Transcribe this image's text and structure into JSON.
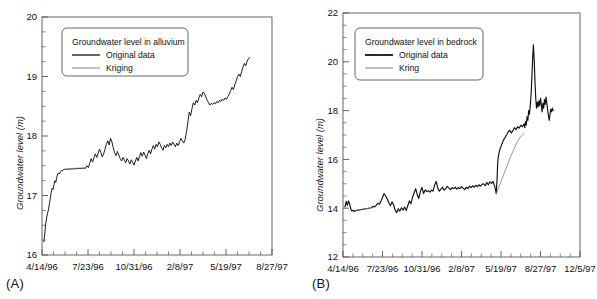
{
  "figure": {
    "background": "#ffffff",
    "line_color": "#111111",
    "axis_color": "#555555"
  },
  "panels": [
    {
      "tag": "(A)",
      "ylabel": "Groundwater level (m)",
      "legend": {
        "title": "Groundwater level in alluvium",
        "entries": [
          {
            "label": "Original data",
            "color": "#111111",
            "width": 1.3
          },
          {
            "label": "Kriging",
            "color": "#777777",
            "width": 0.9
          }
        ]
      },
      "chart_data": {
        "type": "line",
        "title": "Groundwater level in alluvium",
        "xlabel": "",
        "ylabel": "Groundwater level (m)",
        "ylim": [
          16,
          20
        ],
        "yticks": [
          16,
          17,
          18,
          19,
          20
        ],
        "yminor_step": 0.25,
        "xlim": [
          0,
          500
        ],
        "xticks": [
          0,
          100,
          200,
          300,
          400,
          500
        ],
        "xticklabels": [
          "4/14/96",
          "7/23/96",
          "10/31/96",
          "2/8/97",
          "5/19/97",
          "8/27/97"
        ],
        "xminor_per_major": 3,
        "grid": false,
        "legend_position": "upper-left",
        "series": [
          {
            "name": "Original data",
            "color": "#111111",
            "x": [
              4,
              6,
              8,
              10,
              12,
              14,
              16,
              18,
              20,
              22,
              24,
              26,
              28,
              30,
              32,
              34,
              36,
              38,
              40,
              42,
              44,
              46,
              48,
              50,
              95,
              98,
              101,
              104,
              107,
              110,
              113,
              116,
              119,
              122,
              125,
              128,
              131,
              134,
              137,
              140,
              143,
              146,
              149,
              152,
              155,
              158,
              161,
              164,
              167,
              170,
              173,
              176,
              179,
              182,
              185,
              188,
              191,
              194,
              197,
              200,
              203,
              206,
              209,
              212,
              215,
              218,
              221,
              224,
              227,
              230,
              233,
              236,
              239,
              242,
              245,
              248,
              251,
              254,
              257,
              260,
              263,
              266,
              269,
              272,
              275,
              278,
              281,
              284,
              287,
              290,
              293,
              296,
              299,
              302,
              305,
              308,
              311,
              314,
              317,
              320,
              323,
              326,
              329,
              332,
              335,
              338,
              341,
              344,
              347,
              350,
              353,
              356,
              359,
              362,
              365,
              368,
              371,
              374,
              377,
              380,
              383,
              386,
              389,
              392,
              395,
              398,
              401,
              404,
              407,
              410,
              413,
              416,
              419,
              422,
              425,
              428,
              431,
              434,
              437,
              440,
              443,
              446,
              449,
              452
            ],
            "y": [
              16.22,
              16.35,
              16.52,
              16.62,
              16.7,
              16.76,
              16.86,
              16.95,
              17.05,
              17.12,
              17.1,
              17.18,
              17.25,
              17.22,
              17.3,
              17.36,
              17.38,
              17.36,
              17.4,
              17.42,
              17.41,
              17.43,
              17.44,
              17.44,
              17.46,
              17.5,
              17.47,
              17.55,
              17.62,
              17.56,
              17.64,
              17.7,
              17.64,
              17.71,
              17.78,
              17.72,
              17.65,
              17.7,
              17.78,
              17.86,
              17.92,
              17.85,
              17.96,
              17.9,
              17.8,
              17.72,
              17.67,
              17.74,
              17.68,
              17.62,
              17.58,
              17.64,
              17.6,
              17.55,
              17.62,
              17.58,
              17.53,
              17.6,
              17.56,
              17.51,
              17.58,
              17.64,
              17.58,
              17.66,
              17.72,
              17.66,
              17.73,
              17.68,
              17.62,
              17.7,
              17.76,
              17.7,
              17.78,
              17.84,
              17.78,
              17.86,
              17.82,
              17.9,
              17.86,
              17.8,
              17.76,
              17.84,
              17.8,
              17.86,
              17.82,
              17.88,
              17.84,
              17.9,
              17.86,
              17.82,
              17.88,
              17.84,
              17.9,
              17.96,
              17.92,
              17.88,
              17.94,
              18.06,
              18.22,
              18.4,
              18.34,
              18.46,
              18.56,
              18.52,
              18.6,
              18.56,
              18.64,
              18.7,
              18.66,
              18.74,
              18.72,
              18.66,
              18.6,
              18.56,
              18.52,
              18.55,
              18.53,
              18.56,
              18.54,
              18.58,
              18.56,
              18.6,
              18.58,
              18.62,
              18.6,
              18.64,
              18.62,
              18.66,
              18.7,
              18.76,
              18.82,
              18.78,
              18.86,
              18.92,
              19.0,
              19.04,
              19.0,
              19.08,
              19.16,
              19.22,
              19.18,
              19.26,
              19.3,
              19.32
            ]
          },
          {
            "name": "Kriging",
            "color": "#777777",
            "x": [
              50,
              62,
              74,
              86,
              95
            ],
            "y": [
              17.44,
              17.45,
              17.46,
              17.46,
              17.46
            ]
          }
        ]
      }
    },
    {
      "tag": "(B)",
      "ylabel": "Groundwater level (m)",
      "legend": {
        "title": "Groundwater  level in bedrock",
        "entries": [
          {
            "label": "Original data",
            "color": "#111111",
            "width": 1.8
          },
          {
            "label": "Kring",
            "color": "#777777",
            "width": 0.9
          }
        ]
      },
      "chart_data": {
        "type": "line",
        "title": "Groundwater  level in bedrock",
        "xlabel": "",
        "ylabel": "Groundwater level (m)",
        "ylim": [
          12,
          22
        ],
        "yticks": [
          12,
          14,
          16,
          18,
          20,
          22
        ],
        "yminor_step": 0.5,
        "xlim": [
          0,
          600
        ],
        "xticks": [
          0,
          100,
          200,
          300,
          400,
          500,
          600
        ],
        "xticklabels": [
          "4/14/96",
          "7/23/96",
          "10/31/96",
          "2/8/97",
          "5/19/97",
          "8/27/97",
          "12/5/97"
        ],
        "xminor_per_major": 3,
        "grid": false,
        "legend_position": "upper-left",
        "series": [
          {
            "name": "Original data",
            "color": "#111111",
            "x": [
              5,
              8,
              11,
              14,
              17,
              20,
              23,
              26,
              29,
              32,
              72,
              76,
              80,
              84,
              88,
              92,
              96,
              100,
              104,
              108,
              112,
              116,
              120,
              124,
              128,
              132,
              136,
              140,
              144,
              148,
              152,
              156,
              160,
              164,
              168,
              172,
              176,
              180,
              184,
              188,
              192,
              196,
              200,
              204,
              208,
              212,
              216,
              220,
              224,
              228,
              232,
              236,
              240,
              244,
              248,
              252,
              256,
              260,
              264,
              268,
              272,
              276,
              280,
              284,
              288,
              292,
              296,
              300,
              304,
              308,
              312,
              316,
              320,
              324,
              328,
              332,
              336,
              340,
              344,
              348,
              352,
              356,
              360,
              364,
              368,
              372,
              376,
              380,
              384,
              388,
              390,
              391,
              392,
              394,
              398,
              402,
              406,
              410,
              414,
              418,
              422,
              426,
              430,
              434,
              438,
              442,
              446,
              450,
              454,
              458,
              460,
              462,
              464,
              466,
              468,
              470,
              472,
              474,
              476,
              478,
              480,
              482,
              484,
              486,
              488,
              490,
              492,
              494,
              496,
              498,
              500,
              502,
              504,
              506,
              508,
              510,
              512,
              514,
              516,
              518,
              520,
              522,
              524,
              526,
              528,
              530,
              532
            ],
            "y": [
              14.05,
              14.28,
              14.12,
              14.3,
              14.16,
              13.95,
              13.88,
              13.92,
              13.86,
              13.9,
              14.02,
              14.08,
              14.05,
              14.12,
              14.2,
              14.16,
              14.28,
              14.44,
              14.6,
              14.5,
              14.38,
              14.22,
              14.1,
              14.26,
              14.14,
              13.92,
              13.82,
              13.98,
              13.88,
              14.02,
              13.92,
              14.05,
              13.9,
              14.1,
              14.3,
              14.18,
              14.45,
              14.62,
              14.8,
              14.55,
              14.4,
              14.7,
              14.85,
              14.6,
              14.75,
              14.68,
              14.72,
              14.66,
              14.74,
              14.7,
              14.95,
              15.1,
              14.82,
              14.7,
              14.78,
              14.86,
              14.74,
              14.8,
              14.9,
              14.82,
              14.76,
              14.84,
              14.8,
              14.86,
              14.78,
              14.84,
              14.8,
              14.88,
              14.82,
              14.76,
              14.86,
              14.8,
              14.9,
              14.84,
              14.92,
              14.86,
              14.94,
              14.88,
              14.96,
              14.9,
              14.98,
              15.0,
              14.92,
              15.05,
              14.96,
              15.08,
              15.02,
              15.1,
              14.9,
              14.6,
              15.2,
              15.6,
              15.95,
              16.2,
              16.45,
              16.62,
              16.78,
              16.9,
              17.0,
              17.12,
              17.2,
              17.08,
              17.18,
              17.3,
              17.22,
              17.34,
              17.28,
              17.4,
              17.34,
              17.45,
              17.3,
              17.55,
              17.4,
              17.75,
              17.6,
              18.0,
              17.85,
              18.2,
              18.6,
              19.3,
              20.1,
              20.7,
              20.1,
              19.2,
              18.5,
              18.1,
              18.35,
              18.15,
              18.4,
              18.2,
              18.5,
              18.25,
              17.95,
              18.3,
              18.1,
              18.45,
              18.25,
              18.55,
              18.3,
              18.05,
              17.8,
              17.6,
              17.85,
              18.05,
              17.95,
              18.1,
              18.0
            ]
          },
          {
            "name": "Kring",
            "color": "#777777",
            "x": [
              32,
              44,
              56,
              68,
              72
            ],
            "y": [
              13.9,
              13.94,
              13.98,
              14.0,
              14.02
            ]
          },
          {
            "name": "Kring-mid",
            "color": "#777777",
            "x": [
              388,
              400,
              412,
              424,
              436,
              448,
              458
            ],
            "y": [
              14.6,
              15.1,
              15.6,
              16.1,
              16.55,
              16.9,
              17.05
            ]
          }
        ]
      }
    }
  ]
}
